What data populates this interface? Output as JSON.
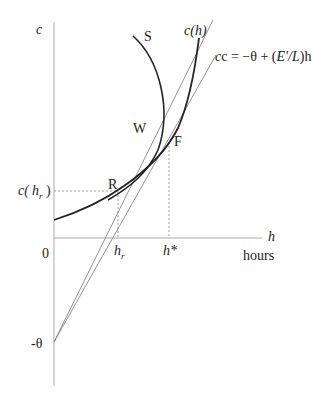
{
  "diagram": {
    "axes": {
      "y_label": "c",
      "x_label": "h",
      "x_unit": "hours",
      "origin": "0"
    },
    "curves": {
      "indifference": "S",
      "cost": "c(h)"
    },
    "points": {
      "R": "R",
      "W": "W",
      "F": "F"
    },
    "line_label": {
      "prefix": "c = −θ + (",
      "ratio": "E'/L",
      "suffix": ")h"
    },
    "ticks": {
      "c_hr_prefix": "c(",
      "c_hr_h": "h",
      "c_hr_sub": "r",
      "c_hr_suffix": " )",
      "hr_h": "h",
      "hr_sub": "r",
      "h_star": "h*",
      "neg_theta": "-θ"
    }
  }
}
